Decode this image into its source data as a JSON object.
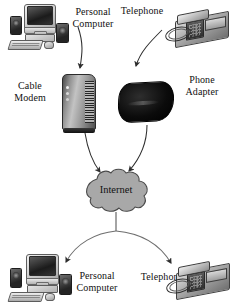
{
  "diagram": {
    "style": {
      "background": "#ffffff",
      "line_color": "#3a3a3a",
      "cloud_fill": "#a8a8a8",
      "cloud_stroke": "#4a4a4a",
      "text_color": "#111111"
    },
    "nodes": [
      {
        "id": "pc-top",
        "label": "Personal\nComputer",
        "icon": "desktop-computer-icon",
        "row": "top",
        "side": "left"
      },
      {
        "id": "telephone-top",
        "label": "Telephone",
        "icon": "desk-telephone-icon",
        "row": "top",
        "side": "right"
      },
      {
        "id": "cable-modem",
        "label": "Cable\nModem",
        "icon": "cable-modem-icon",
        "row": "middle",
        "side": "left"
      },
      {
        "id": "phone-adapter",
        "label": "Phone\nAdapter",
        "icon": "phone-adapter-icon",
        "row": "middle",
        "side": "right"
      },
      {
        "id": "internet",
        "label": "Internet",
        "icon": "cloud-icon",
        "row": "center",
        "side": "center"
      },
      {
        "id": "pc-bottom",
        "label": "Personal\nComputer",
        "icon": "desktop-computer-icon",
        "row": "bottom",
        "side": "left"
      },
      {
        "id": "telephone-bottom",
        "label": "Telephone",
        "icon": "desk-telephone-icon",
        "row": "bottom",
        "side": "right"
      }
    ],
    "connections": [
      {
        "from": "pc-top",
        "to": "cable-modem",
        "arrow": true
      },
      {
        "from": "telephone-top",
        "to": "phone-adapter",
        "arrow": true
      },
      {
        "from": "cable-modem",
        "to": "internet",
        "arrow": true
      },
      {
        "from": "phone-adapter",
        "to": "internet",
        "arrow": true
      },
      {
        "from": "internet",
        "to": "pc-bottom",
        "arrow": true
      },
      {
        "from": "internet",
        "to": "telephone-bottom",
        "arrow": true
      }
    ],
    "labels": {
      "pc_top": "Personal\nComputer",
      "telephone_top": "Telephone",
      "cable_modem": "Cable\nModem",
      "phone_adapter": "Phone\nAdapter",
      "internet": "Internet",
      "pc_bottom": "Personal\nComputer",
      "telephone_bottom": "Telephone"
    }
  }
}
